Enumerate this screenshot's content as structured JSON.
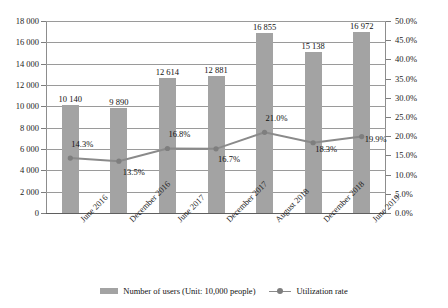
{
  "chart_data": {
    "type": "bar",
    "title": "",
    "categories": [
      "June 2016",
      "December 2016",
      "June 2017",
      "December 2017",
      "August 2018",
      "December 2018",
      "June 2019"
    ],
    "series": [
      {
        "name": "Number of users (Unit: 10,000 people)",
        "type": "bar",
        "axis": "left",
        "values": [
          10140,
          9890,
          12614,
          12881,
          16855,
          15138,
          16972
        ],
        "labels": [
          "10 140",
          "9 890",
          "12 614",
          "12 881",
          "16 855",
          "15 138",
          "16 972"
        ],
        "color": "#a3a3a3"
      },
      {
        "name": "Utilization rate",
        "type": "line",
        "axis": "right",
        "values": [
          14.3,
          13.5,
          16.8,
          16.7,
          21.0,
          18.3,
          19.9
        ],
        "labels": [
          "14.3%",
          "13.5%",
          "16.8%",
          "16.7%",
          "21.0%",
          "18.3%",
          "19.9%"
        ],
        "color": "#8a8a8a"
      }
    ],
    "xlabel": "",
    "ylabel": "",
    "ylim": [
      0,
      18000
    ],
    "y_ticks": [
      0,
      2000,
      4000,
      6000,
      8000,
      10000,
      12000,
      14000,
      16000,
      18000
    ],
    "y_tick_labels": [
      "0",
      "2 000",
      "4 000",
      "6 000",
      "8 000",
      "10 000",
      "12 000",
      "14 000",
      "16 000",
      "18 000"
    ],
    "y2lim": [
      0,
      50
    ],
    "y2_ticks": [
      0,
      5,
      10,
      15,
      20,
      25,
      30,
      35,
      40,
      45,
      50
    ],
    "y2_tick_labels": [
      "0.0%",
      "5.0%",
      "10.0%",
      "15.0%",
      "20.0%",
      "25.0%",
      "30.0%",
      "35.0%",
      "40.0%",
      "45.0%",
      "50.0%"
    ],
    "grid": true,
    "legend_position": "bottom"
  },
  "legend": {
    "bars_label": "Number of users (Unit: 10,000 people)",
    "line_label": "Utilization rate"
  }
}
